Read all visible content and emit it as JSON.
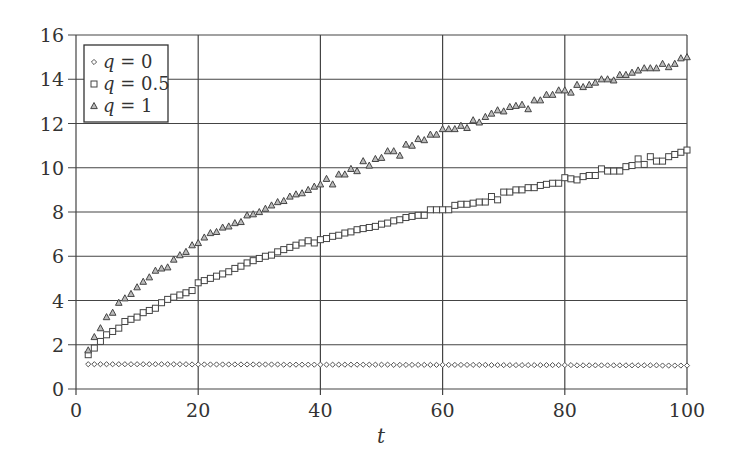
{
  "chart_data": {
    "type": "scatter",
    "title": "",
    "xlabel": "t",
    "ylabel": "",
    "xlim": [
      0,
      100
    ],
    "ylim": [
      0,
      16
    ],
    "xticks": [
      0,
      20,
      40,
      60,
      80,
      100
    ],
    "yticks": [
      0,
      2,
      4,
      6,
      8,
      10,
      12,
      14,
      16
    ],
    "grid": true,
    "legend_position": "upper-left",
    "x": [
      2,
      3,
      4,
      5,
      6,
      7,
      8,
      9,
      10,
      11,
      12,
      13,
      14,
      15,
      16,
      17,
      18,
      19,
      20,
      21,
      22,
      23,
      24,
      25,
      26,
      27,
      28,
      29,
      30,
      31,
      32,
      33,
      34,
      35,
      36,
      37,
      38,
      39,
      40,
      41,
      42,
      43,
      44,
      45,
      46,
      47,
      48,
      49,
      50,
      51,
      52,
      53,
      54,
      55,
      56,
      57,
      58,
      59,
      60,
      61,
      62,
      63,
      64,
      65,
      66,
      67,
      68,
      69,
      70,
      71,
      72,
      73,
      74,
      75,
      76,
      77,
      78,
      79,
      80,
      81,
      82,
      83,
      84,
      85,
      86,
      87,
      88,
      89,
      90,
      91,
      92,
      93,
      94,
      95,
      96,
      97,
      98,
      99,
      100
    ],
    "series": [
      {
        "name": "q = 0",
        "marker": "diamond",
        "values": [
          1.12,
          1.12,
          1.12,
          1.12,
          1.12,
          1.12,
          1.12,
          1.12,
          1.12,
          1.12,
          1.12,
          1.12,
          1.12,
          1.12,
          1.12,
          1.12,
          1.12,
          1.11,
          1.11,
          1.11,
          1.11,
          1.11,
          1.11,
          1.11,
          1.11,
          1.11,
          1.11,
          1.11,
          1.11,
          1.11,
          1.11,
          1.11,
          1.1,
          1.1,
          1.1,
          1.1,
          1.1,
          1.1,
          1.1,
          1.1,
          1.1,
          1.1,
          1.1,
          1.1,
          1.1,
          1.1,
          1.1,
          1.1,
          1.1,
          1.1,
          1.09,
          1.09,
          1.09,
          1.09,
          1.09,
          1.09,
          1.09,
          1.09,
          1.09,
          1.09,
          1.09,
          1.09,
          1.09,
          1.09,
          1.09,
          1.09,
          1.08,
          1.08,
          1.08,
          1.08,
          1.08,
          1.08,
          1.08,
          1.08,
          1.08,
          1.08,
          1.08,
          1.08,
          1.08,
          1.08,
          1.07,
          1.07,
          1.07,
          1.07,
          1.07,
          1.07,
          1.07,
          1.07,
          1.07,
          1.07,
          1.07,
          1.07,
          1.07,
          1.07,
          1.06,
          1.06,
          1.06,
          1.06,
          1.06
        ]
      },
      {
        "name": "q = 0.5",
        "marker": "square",
        "values": [
          1.55,
          1.85,
          2.15,
          2.45,
          2.6,
          2.75,
          3.05,
          3.15,
          3.25,
          3.45,
          3.55,
          3.65,
          3.9,
          4.05,
          4.15,
          4.25,
          4.35,
          4.45,
          4.8,
          4.9,
          5.0,
          5.1,
          5.2,
          5.3,
          5.45,
          5.55,
          5.7,
          5.8,
          5.9,
          6.0,
          6.05,
          6.2,
          6.3,
          6.4,
          6.5,
          6.6,
          6.7,
          6.6,
          6.75,
          6.8,
          6.9,
          6.95,
          7.05,
          7.1,
          7.2,
          7.25,
          7.3,
          7.35,
          7.45,
          7.5,
          7.6,
          7.65,
          7.75,
          7.8,
          7.85,
          7.85,
          8.1,
          8.1,
          8.1,
          8.1,
          8.3,
          8.35,
          8.35,
          8.4,
          8.45,
          8.45,
          8.7,
          8.55,
          8.9,
          8.9,
          9.0,
          9.0,
          9.1,
          9.1,
          9.2,
          9.25,
          9.3,
          9.3,
          9.55,
          9.5,
          9.45,
          9.6,
          9.65,
          9.65,
          9.95,
          9.85,
          9.85,
          9.85,
          10.05,
          10.1,
          10.4,
          10.15,
          10.5,
          10.3,
          10.3,
          10.5,
          10.6,
          10.7,
          10.8
        ]
      },
      {
        "name": "q = 1",
        "marker": "triangle",
        "values": [
          1.75,
          2.35,
          2.75,
          3.25,
          3.45,
          3.9,
          4.1,
          4.3,
          4.6,
          4.85,
          5.05,
          5.35,
          5.45,
          5.5,
          5.85,
          6.05,
          6.2,
          6.5,
          6.6,
          6.85,
          7.05,
          7.1,
          7.3,
          7.35,
          7.5,
          7.55,
          7.85,
          7.9,
          8.0,
          8.15,
          8.3,
          8.45,
          8.5,
          8.7,
          8.8,
          8.85,
          9.0,
          9.15,
          9.25,
          9.5,
          9.25,
          9.7,
          9.7,
          9.95,
          9.85,
          10.3,
          10.1,
          10.4,
          10.45,
          10.75,
          10.75,
          10.55,
          11.05,
          11.0,
          11.3,
          11.25,
          11.5,
          11.5,
          11.75,
          11.75,
          11.75,
          11.9,
          11.8,
          12.15,
          12.05,
          12.3,
          12.45,
          12.6,
          12.55,
          12.75,
          12.8,
          12.85,
          12.65,
          13.05,
          13.05,
          13.3,
          13.3,
          13.5,
          13.5,
          13.4,
          13.75,
          13.65,
          13.75,
          13.85,
          14.0,
          14.0,
          13.95,
          14.2,
          14.2,
          14.3,
          14.4,
          14.5,
          14.5,
          14.5,
          14.7,
          14.55,
          14.7,
          14.95,
          15.0
        ]
      }
    ]
  }
}
